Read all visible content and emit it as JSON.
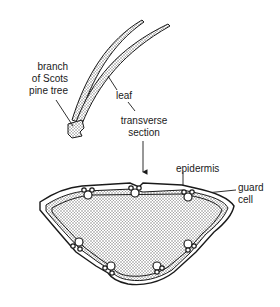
{
  "diagram": {
    "labels": {
      "branch": [
        "branch",
        "of Scots",
        "pine tree"
      ],
      "leaf": "leaf",
      "transverse_section": [
        "transverse",
        "section"
      ],
      "epidermis": "epidermis",
      "guard_cell": [
        "guard",
        "cell"
      ]
    },
    "colors": {
      "ink": "#1a1a1a",
      "stipple": "#bdbdbd",
      "background": "#ffffff"
    }
  }
}
